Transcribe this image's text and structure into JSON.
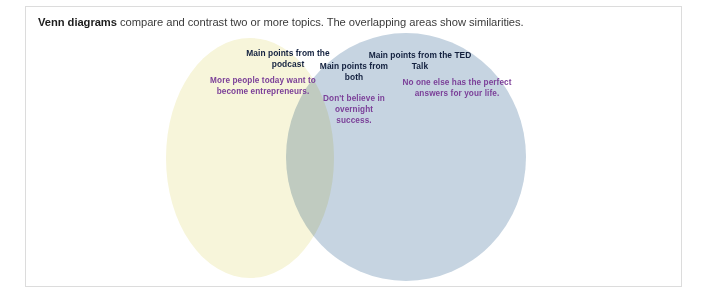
{
  "heading": {
    "bold_part": "Venn diagrams",
    "rest_part": " compare and contrast two or more topics. The overlapping areas show similarities."
  },
  "diagram": {
    "type": "venn",
    "circles": [
      {
        "id": "left",
        "fill": "#f7f5da",
        "heading": "Main points from the podcast",
        "body": "More people today want to become entrepreneurs."
      },
      {
        "id": "right",
        "fill": "#c6d4e1",
        "heading": "Main points from the TED Talk",
        "body": "No one else has the perfect answers for your life."
      }
    ],
    "overlap": {
      "id": "center",
      "fill": "#ccd6d4",
      "heading": "Main points from both",
      "body": "Don't believe in overnight success."
    },
    "colors": {
      "heading_text": "#13213f",
      "body_text": "#7b3f98",
      "card_border": "#dcdcdc",
      "page_background": "#ffffff",
      "intro_text": "#3b3b3b"
    }
  }
}
